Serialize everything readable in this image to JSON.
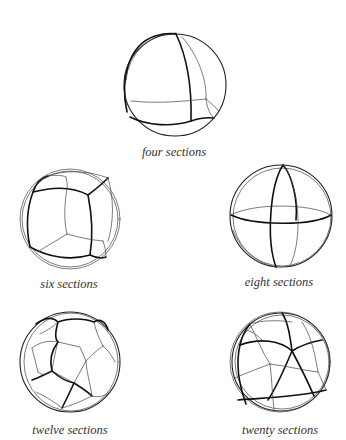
{
  "figures": [
    {
      "id": "four",
      "caption": "four sections",
      "sections": 4,
      "cx": 175,
      "cy": 85,
      "r": 51
    },
    {
      "id": "six",
      "caption": "six sections",
      "sections": 6,
      "cx": 70,
      "cy": 219,
      "r": 50
    },
    {
      "id": "eight",
      "caption": "eight sections",
      "sections": 8,
      "cx": 281,
      "cy": 216,
      "r": 51
    },
    {
      "id": "twelve",
      "caption": "twelve sections",
      "sections": 12,
      "cx": 70,
      "cy": 362,
      "r": 50
    },
    {
      "id": "twenty",
      "caption": "twenty sections",
      "sections": 20,
      "cx": 281,
      "cy": 362,
      "r": 49
    }
  ],
  "colors": {
    "background": "#ffffff",
    "line": "#111111",
    "caption": "#333333"
  }
}
